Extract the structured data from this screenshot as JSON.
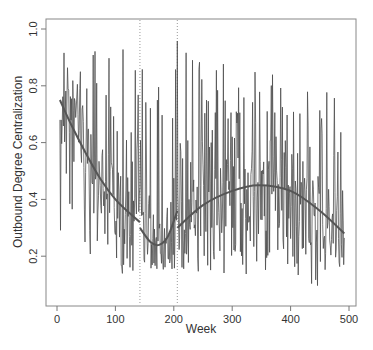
{
  "chart_data": {
    "type": "line",
    "title": "",
    "xlabel": "Week",
    "ylabel": "Outbound Degree Centralization",
    "xlim": [
      0,
      500
    ],
    "ylim": [
      0.05,
      1.03
    ],
    "x_ticks": [
      0,
      100,
      200,
      300,
      400,
      500
    ],
    "x_tick_labels": [
      "0",
      "100",
      "200",
      "300",
      "400",
      "500"
    ],
    "y_ticks": [
      0.2,
      0.4,
      0.6,
      0.8,
      1.0
    ],
    "y_tick_labels": [
      "0.2",
      "0.4",
      "0.6",
      "0.8",
      "1.0"
    ],
    "grid": false,
    "legend": null,
    "vertical_reference_lines": [
      {
        "x": 142,
        "style": "dotted"
      },
      {
        "x": 206,
        "style": "dotted"
      }
    ],
    "series": [
      {
        "name": "weekly centralization",
        "style": "noisy line",
        "color": "#4a4a4a",
        "x_range": [
          5,
          492
        ],
        "approx_envelope": [
          {
            "x": 10,
            "min": 0.28,
            "max": 1.0
          },
          {
            "x": 50,
            "min": 0.22,
            "max": 0.95
          },
          {
            "x": 100,
            "min": 0.13,
            "max": 0.97
          },
          {
            "x": 150,
            "min": 0.16,
            "max": 0.93
          },
          {
            "x": 200,
            "min": 0.15,
            "max": 0.98
          },
          {
            "x": 250,
            "min": 0.14,
            "max": 0.97
          },
          {
            "x": 300,
            "min": 0.13,
            "max": 0.87
          },
          {
            "x": 350,
            "min": 0.12,
            "max": 0.85
          },
          {
            "x": 400,
            "min": 0.14,
            "max": 0.85
          },
          {
            "x": 450,
            "min": 0.08,
            "max": 0.93
          },
          {
            "x": 490,
            "min": 0.17,
            "max": 0.68
          }
        ]
      },
      {
        "name": "fit segment 1",
        "style": "smooth",
        "color": "#555555",
        "points": [
          [
            5,
            0.75
          ],
          [
            25,
            0.66
          ],
          [
            50,
            0.56
          ],
          [
            75,
            0.47
          ],
          [
            100,
            0.4
          ],
          [
            125,
            0.35
          ],
          [
            142,
            0.32
          ]
        ]
      },
      {
        "name": "fit segment 2",
        "style": "smooth",
        "color": "#555555",
        "points": [
          [
            142,
            0.3
          ],
          [
            160,
            0.25
          ],
          [
            175,
            0.24
          ],
          [
            190,
            0.27
          ],
          [
            206,
            0.36
          ]
        ]
      },
      {
        "name": "fit segment 3",
        "style": "smooth",
        "color": "#555555",
        "points": [
          [
            206,
            0.3
          ],
          [
            250,
            0.38
          ],
          [
            300,
            0.43
          ],
          [
            345,
            0.45
          ],
          [
            400,
            0.43
          ],
          [
            450,
            0.36
          ],
          [
            492,
            0.28
          ]
        ]
      }
    ]
  }
}
